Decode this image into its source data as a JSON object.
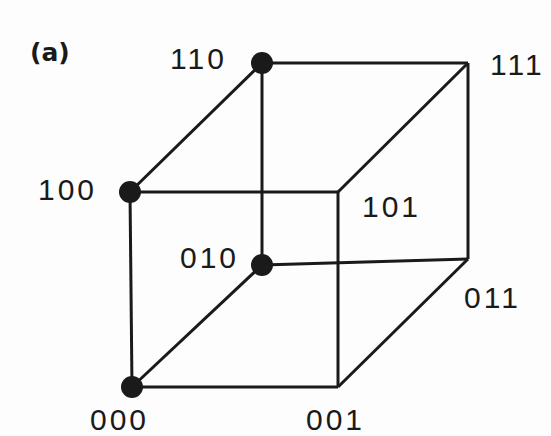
{
  "figure": {
    "panel_label": "(a)",
    "caption_type": "3-cube vertex labeling diagram",
    "background_color": "#fdfdfd",
    "line_color": "#1a1a1a",
    "node_fill_color": "#1a1a1a",
    "label_color": "#1a1a1a",
    "line_width": 3,
    "node_radius": 11
  },
  "vertices": [
    {
      "id": "v110",
      "label": "110",
      "x": 262,
      "y": 63,
      "filled": true,
      "label_x": 170,
      "label_y": 44,
      "label_anchor": "left"
    },
    {
      "id": "v111",
      "label": "111",
      "x": 468,
      "y": 63,
      "filled": false,
      "label_x": 490,
      "label_y": 50,
      "label_anchor": "left"
    },
    {
      "id": "v100",
      "label": "100",
      "x": 130,
      "y": 192,
      "filled": true,
      "label_x": 38,
      "label_y": 175,
      "label_anchor": "left"
    },
    {
      "id": "v101",
      "label": "101",
      "x": 338,
      "y": 192,
      "filled": false,
      "label_x": 362,
      "label_y": 192,
      "label_anchor": "left"
    },
    {
      "id": "v010",
      "label": "010",
      "x": 262,
      "y": 265,
      "filled": true,
      "label_x": 180,
      "label_y": 243,
      "label_anchor": "left"
    },
    {
      "id": "v011",
      "label": "011",
      "x": 468,
      "y": 259,
      "filled": false,
      "label_x": 464,
      "label_y": 283,
      "label_anchor": "left"
    },
    {
      "id": "v000",
      "label": "000",
      "x": 132,
      "y": 387,
      "filled": true,
      "label_x": 90,
      "label_y": 405,
      "label_anchor": "left"
    },
    {
      "id": "v001",
      "label": "001",
      "x": 338,
      "y": 387,
      "filled": false,
      "label_x": 306,
      "label_y": 405,
      "label_anchor": "left"
    }
  ],
  "edges": [
    {
      "id": "e-110-111",
      "from": "v110",
      "to": "v111"
    },
    {
      "id": "e-111-011",
      "from": "v111",
      "to": "v011"
    },
    {
      "id": "e-011-010",
      "from": "v011",
      "to": "v010"
    },
    {
      "id": "e-010-110",
      "from": "v010",
      "to": "v110"
    },
    {
      "id": "e-100-101",
      "from": "v100",
      "to": "v101"
    },
    {
      "id": "e-101-001",
      "from": "v101",
      "to": "v001"
    },
    {
      "id": "e-001-000",
      "from": "v001",
      "to": "v000"
    },
    {
      "id": "e-000-100",
      "from": "v000",
      "to": "v100"
    },
    {
      "id": "e-100-110",
      "from": "v100",
      "to": "v110"
    },
    {
      "id": "e-101-111",
      "from": "v101",
      "to": "v111"
    },
    {
      "id": "e-001-011",
      "from": "v001",
      "to": "v011"
    },
    {
      "id": "e-000-010",
      "from": "v000",
      "to": "v010"
    }
  ]
}
